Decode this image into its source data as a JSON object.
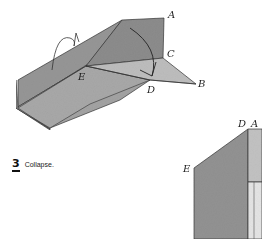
{
  "diagram": {
    "type": "origami-folding-step",
    "step": {
      "number": "3",
      "instruction": "Collapse."
    },
    "figure_1": {
      "labels": {
        "A": "A",
        "B": "B",
        "C": "C",
        "D": "D",
        "E": "E"
      }
    },
    "figure_2": {
      "labels": {
        "D": "D",
        "E": "E",
        "A_partial": "A"
      }
    },
    "colors": {
      "paper_dark": "#8f8f8f",
      "paper_mid": "#a6a6a6",
      "paper_light": "#c4c4c4",
      "line": "#333333"
    }
  }
}
